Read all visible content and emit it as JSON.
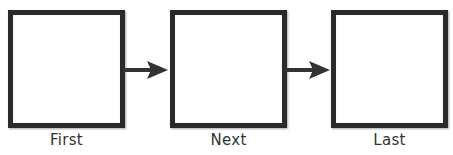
{
  "diagram": {
    "type": "flow",
    "direction": "left-to-right",
    "nodes": [
      {
        "id": "first",
        "label": "First"
      },
      {
        "id": "next",
        "label": "Next"
      },
      {
        "id": "last",
        "label": "Last"
      }
    ],
    "edges": [
      {
        "from": "first",
        "to": "next"
      },
      {
        "from": "next",
        "to": "last"
      }
    ]
  },
  "colors": {
    "box_border": "#2a2a2a",
    "box_fill": "#ffffff",
    "arrow": "#333333",
    "label_text": "#333333"
  }
}
